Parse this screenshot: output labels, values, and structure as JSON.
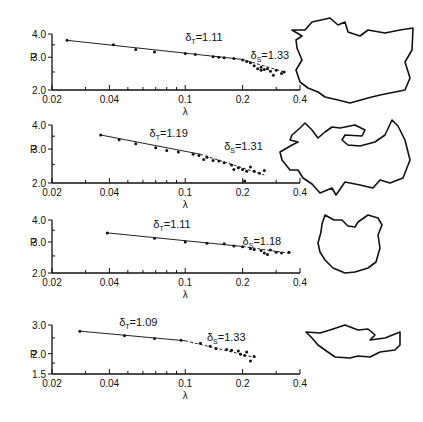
{
  "figure": {
    "x_axis": {
      "label": "λ",
      "scale": "log",
      "range": [
        0.02,
        0.4
      ],
      "tick_labels": [
        "0.02",
        "0.04",
        "0.1",
        "0.2",
        "0.4"
      ],
      "tick_values": [
        0.02,
        0.04,
        0.1,
        0.2,
        0.4
      ],
      "minor_ticks": [
        0.03,
        0.05,
        0.06,
        0.07,
        0.08,
        0.09,
        0.3
      ]
    },
    "y_label": "P"
  },
  "chart_data": [
    {
      "type": "scatter",
      "panel": 1,
      "xlabel": "λ",
      "ylabel": "P",
      "xscale": "log",
      "yscale": "log",
      "xlim": [
        0.02,
        0.4
      ],
      "ylim": [
        2.0,
        4.0
      ],
      "ytick_labels": [
        "2.0",
        "3.0",
        "4.0"
      ],
      "annotations": [
        {
          "text": "δT=1.11",
          "sym": "δ",
          "sub": "T",
          "val": "=1.11",
          "x": 0.1,
          "y": 3.65
        },
        {
          "text": "δS=1.33",
          "sym": "δ",
          "sub": "S",
          "val": "=1.33",
          "x": 0.22,
          "y": 2.95
        }
      ],
      "points": [
        [
          0.024,
          3.7
        ],
        [
          0.042,
          3.5
        ],
        [
          0.055,
          3.3
        ],
        [
          0.069,
          3.2
        ],
        [
          0.1,
          3.14
        ],
        [
          0.113,
          3.1
        ],
        [
          0.14,
          3.02
        ],
        [
          0.15,
          3.0
        ],
        [
          0.16,
          2.98
        ],
        [
          0.18,
          2.95
        ],
        [
          0.2,
          2.9
        ],
        [
          0.21,
          2.85
        ],
        [
          0.22,
          2.8
        ],
        [
          0.23,
          2.7
        ],
        [
          0.24,
          2.6
        ],
        [
          0.25,
          2.65
        ],
        [
          0.26,
          2.58
        ],
        [
          0.27,
          2.6
        ],
        [
          0.28,
          2.52
        ],
        [
          0.3,
          2.55
        ],
        [
          0.32,
          2.45
        ],
        [
          0.33,
          2.5
        ],
        [
          0.25,
          2.55
        ],
        [
          0.29,
          2.4
        ]
      ],
      "fit_lines": [
        {
          "name": "δT",
          "from": [
            0.024,
            3.7
          ],
          "to": [
            0.2,
            2.92
          ]
        },
        {
          "name": "δS",
          "from": [
            0.2,
            2.92
          ],
          "to": [
            0.33,
            2.5
          ]
        }
      ]
    },
    {
      "type": "scatter",
      "panel": 2,
      "xlabel": "λ",
      "ylabel": "P",
      "xscale": "log",
      "yscale": "log",
      "xlim": [
        0.02,
        0.4
      ],
      "ylim": [
        2.0,
        4.0
      ],
      "ytick_labels": [
        "2.0",
        "3.0",
        "4.0"
      ],
      "annotations": [
        {
          "text": "δT=1.19",
          "sym": "δ",
          "sub": "T",
          "val": "=1.19",
          "x": 0.065,
          "y": 3.45
        },
        {
          "text": "δS=1.31",
          "sym": "δ",
          "sub": "S",
          "val": "=1.31",
          "x": 0.16,
          "y": 2.95
        }
      ],
      "points": [
        [
          0.036,
          3.55
        ],
        [
          0.045,
          3.35
        ],
        [
          0.055,
          3.2
        ],
        [
          0.07,
          3.05
        ],
        [
          0.08,
          2.95
        ],
        [
          0.092,
          2.9
        ],
        [
          0.11,
          2.82
        ],
        [
          0.118,
          2.78
        ],
        [
          0.125,
          2.65
        ],
        [
          0.13,
          2.72
        ],
        [
          0.14,
          2.62
        ],
        [
          0.15,
          2.6
        ],
        [
          0.16,
          2.55
        ],
        [
          0.175,
          2.48
        ],
        [
          0.18,
          2.35
        ],
        [
          0.19,
          2.4
        ],
        [
          0.2,
          2.35
        ],
        [
          0.21,
          2.3
        ],
        [
          0.22,
          2.42
        ],
        [
          0.23,
          2.3
        ],
        [
          0.245,
          2.25
        ],
        [
          0.26,
          2.32
        ],
        [
          0.205,
          2.05
        ]
      ],
      "fit_lines": [
        {
          "name": "δT",
          "from": [
            0.036,
            3.55
          ],
          "to": [
            0.12,
            2.82
          ]
        },
        {
          "name": "δS",
          "from": [
            0.12,
            2.82
          ],
          "to": [
            0.26,
            2.2
          ]
        }
      ]
    },
    {
      "type": "scatter",
      "panel": 3,
      "xlabel": "λ",
      "ylabel": "P",
      "xscale": "log",
      "yscale": "log",
      "xlim": [
        0.02,
        0.4
      ],
      "ylim": [
        2.0,
        4.0
      ],
      "ytick_labels": [
        "2.0",
        "3.0",
        "4.0"
      ],
      "annotations": [
        {
          "text": "δT=1.11",
          "sym": "δ",
          "sub": "T",
          "val": "=1.11",
          "x": 0.068,
          "y": 3.6
        },
        {
          "text": "δS=1.18",
          "sym": "δ",
          "sub": "S",
          "val": "=1.18",
          "x": 0.2,
          "y": 2.9
        }
      ],
      "points": [
        [
          0.039,
          3.38
        ],
        [
          0.069,
          3.15
        ],
        [
          0.1,
          3.0
        ],
        [
          0.13,
          2.95
        ],
        [
          0.16,
          2.93
        ],
        [
          0.18,
          2.85
        ],
        [
          0.2,
          2.82
        ],
        [
          0.22,
          2.75
        ],
        [
          0.23,
          2.72
        ],
        [
          0.25,
          2.68
        ],
        [
          0.26,
          2.6
        ],
        [
          0.27,
          2.55
        ],
        [
          0.28,
          2.7
        ],
        [
          0.3,
          2.62
        ],
        [
          0.32,
          2.6
        ],
        [
          0.35,
          2.62
        ]
      ],
      "fit_lines": [
        {
          "name": "δT",
          "from": [
            0.039,
            3.38
          ],
          "to": [
            0.2,
            2.83
          ]
        },
        {
          "name": "δS",
          "from": [
            0.2,
            2.83
          ],
          "to": [
            0.36,
            2.58
          ]
        }
      ]
    },
    {
      "type": "scatter",
      "panel": 4,
      "xlabel": "λ",
      "ylabel": "P",
      "xscale": "log",
      "yscale": "log",
      "xlim": [
        0.02,
        0.4
      ],
      "ylim": [
        1.5,
        3.0
      ],
      "ytick_labels": [
        "1.5",
        "2.0",
        "3.0"
      ],
      "annotations": [
        {
          "text": "δT=1.09",
          "sym": "δ",
          "sub": "T",
          "val": "=1.09",
          "x": 0.045,
          "y": 2.95
        },
        {
          "text": "δS=1.33",
          "sym": "δ",
          "sub": "S",
          "val": "=1.33",
          "x": 0.13,
          "y": 2.4
        }
      ],
      "points": [
        [
          0.028,
          2.75
        ],
        [
          0.048,
          2.58
        ],
        [
          0.069,
          2.48
        ],
        [
          0.095,
          2.42
        ],
        [
          0.12,
          2.32
        ],
        [
          0.135,
          2.22
        ],
        [
          0.145,
          2.15
        ],
        [
          0.165,
          2.12
        ],
        [
          0.175,
          2.1
        ],
        [
          0.19,
          2.08
        ],
        [
          0.195,
          1.98
        ],
        [
          0.205,
          1.95
        ],
        [
          0.21,
          2.05
        ],
        [
          0.22,
          1.8
        ],
        [
          0.23,
          1.92
        ]
      ],
      "fit_lines": [
        {
          "name": "δT",
          "from": [
            0.028,
            2.75
          ],
          "to": [
            0.1,
            2.4
          ]
        },
        {
          "name": "δS",
          "from": [
            0.1,
            2.4
          ],
          "to": [
            0.23,
            1.9
          ]
        }
      ]
    }
  ],
  "shapes": [
    {
      "name": "outline-1",
      "points": "305,30 312,22 330,18 338,25 345,22 348,32 360,36 368,30 385,33 400,30 413,28 412,50 405,62 410,78 405,90 395,92 380,95 368,98 350,103 338,100 325,97 318,92 308,88 300,82 296,70 302,60 297,48 296,40 302,36 292,30"
    },
    {
      "name": "outline-2",
      "points": "292,135 300,128 305,123 312,130 318,138 325,132 332,127 340,128 355,125 365,130 362,136 345,135 342,140 348,145 360,146 375,142 385,135 392,120 398,126 405,140 410,160 403,178 390,183 380,180 373,188 360,185 345,182 336,195 332,188 320,193 312,184 303,178 298,170 290,170 282,160 280,152 292,145 298,142 290,140"
    },
    {
      "name": "outline-3",
      "points": "325,215 334,220 342,220 348,226 355,227 358,222 368,215 378,218 382,225 378,235 380,248 376,262 368,268 355,272 345,273 333,268 325,260 320,252 318,243 321,232 322,224"
    },
    {
      "name": "outline-4",
      "points": "306,332 320,333 330,330 345,325 358,330 368,329 375,335 370,340 385,338 400,332 400,345 395,350 380,352 370,357 358,356 350,358 335,357 325,350 318,345 312,338"
    }
  ]
}
